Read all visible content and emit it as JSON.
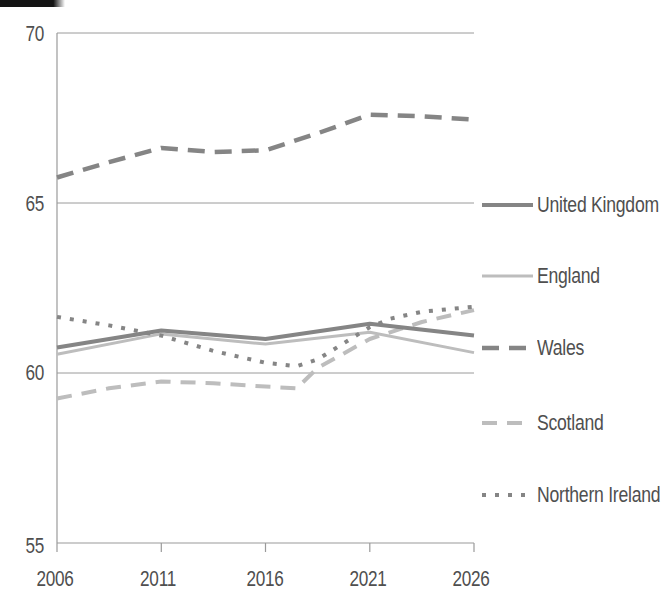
{
  "page": {
    "background": "#ffffff",
    "header_bar_color": "#141414"
  },
  "chart_data": {
    "type": "line",
    "title": "",
    "xlabel": "",
    "ylabel": "",
    "xlim": [
      2006,
      2026
    ],
    "ylim": [
      55,
      70
    ],
    "x_ticks": [
      "2006",
      "2011",
      "2016",
      "2021",
      "2026"
    ],
    "y_ticks": [
      "70",
      "65",
      "60",
      "55"
    ],
    "gridlines_at": [
      70,
      65,
      60
    ],
    "grid": "horizontal only",
    "legend_position": "right of plot, vertical stack",
    "colors": {
      "dark_line": "#858585",
      "light_line": "#bdbdbd",
      "axis": "#9a9a9a",
      "label_text": "#4f4f4f"
    },
    "series": [
      {
        "name": "United Kingdom",
        "tone": "dark",
        "style": "solid",
        "width": 4,
        "z": 3,
        "x": [
          2006,
          2011,
          2016,
          2021,
          2026
        ],
        "values": [
          60.75,
          61.25,
          61.0,
          61.45,
          61.1
        ]
      },
      {
        "name": "England",
        "tone": "light",
        "style": "solid",
        "width": 3,
        "z": 1,
        "x": [
          2006,
          2011,
          2016,
          2021,
          2026
        ],
        "values": [
          60.55,
          61.15,
          60.85,
          61.2,
          60.6
        ]
      },
      {
        "name": "Wales",
        "tone": "dark",
        "style": "dashed",
        "width": 4.5,
        "z": 4,
        "x": [
          2006,
          2008.5,
          2011,
          2013.5,
          2016,
          2018.5,
          2021,
          2023.5,
          2026
        ],
        "values": [
          65.75,
          66.2,
          66.62,
          66.5,
          66.55,
          67.05,
          67.6,
          67.55,
          67.45
        ]
      },
      {
        "name": "Scotland",
        "tone": "light",
        "style": "dashed",
        "width": 4,
        "z": 2,
        "x": [
          2006,
          2008.5,
          2011,
          2013.5,
          2016,
          2017.5,
          2018.5,
          2021,
          2023.5,
          2026
        ],
        "values": [
          59.25,
          59.55,
          59.75,
          59.7,
          59.6,
          59.55,
          60.15,
          61.0,
          61.5,
          61.85
        ]
      },
      {
        "name": "Northern Ireland",
        "tone": "dark",
        "style": "dotted",
        "width": 4,
        "z": 5,
        "x": [
          2006,
          2008.5,
          2011,
          2013.5,
          2016,
          2017.5,
          2018.5,
          2021,
          2022,
          2023.5,
          2026
        ],
        "values": [
          61.65,
          61.4,
          61.1,
          60.65,
          60.3,
          60.2,
          60.4,
          61.35,
          61.6,
          61.8,
          61.95
        ]
      }
    ]
  }
}
